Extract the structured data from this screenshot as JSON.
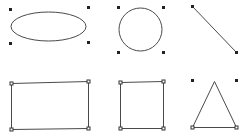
{
  "canvas": {
    "background": "#ffffff",
    "stroke_color": "#4a4a4a",
    "handle_color": "#222222"
  },
  "shapes": [
    {
      "name": "ellipse",
      "type": "ellipse",
      "selected": true,
      "handle_style": "solid-corner"
    },
    {
      "name": "circle",
      "type": "circle",
      "selected": true,
      "handle_style": "solid-corner"
    },
    {
      "name": "line",
      "type": "line",
      "selected": true,
      "handle_style": "solid-endpoint"
    },
    {
      "name": "rectangle",
      "type": "rectangle",
      "selected": true,
      "handle_style": "hollow-vertex"
    },
    {
      "name": "square",
      "type": "square",
      "selected": true,
      "handle_style": "hollow-vertex"
    },
    {
      "name": "triangle",
      "type": "triangle",
      "selected": true,
      "handle_style": "hollow-vertex-plus-solid-corner"
    }
  ]
}
